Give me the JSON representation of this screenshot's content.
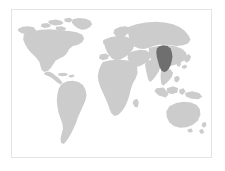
{
  "map": {
    "title": "World locator map",
    "projection": "equirectangular",
    "frame": {
      "visible": true,
      "border_color": "#e4e4e4",
      "x": 11,
      "y": 9,
      "width": 201,
      "height": 149
    },
    "colors": {
      "ocean": "#ffffff",
      "background": "#ffffff",
      "land": "#cccccc",
      "highlight": "#6f6f6f"
    },
    "legend": {
      "visible": false,
      "entries": []
    },
    "labels": {
      "visible": false,
      "items": []
    },
    "graticule": {
      "visible": false
    },
    "highlight": {
      "region_name": "China",
      "continent": "Asia",
      "color": "#6f6f6f",
      "approx_center_x": 169,
      "approx_center_y": 74
    },
    "landmasses": [
      {
        "name": "North America",
        "highlighted": false
      },
      {
        "name": "Greenland",
        "highlighted": false
      },
      {
        "name": "South America",
        "highlighted": false
      },
      {
        "name": "Europe",
        "highlighted": false
      },
      {
        "name": "Africa",
        "highlighted": false
      },
      {
        "name": "Asia",
        "highlighted": false
      },
      {
        "name": "China",
        "highlighted": true
      },
      {
        "name": "Southeast Asia and Indonesia",
        "highlighted": false
      },
      {
        "name": "Australia",
        "highlighted": false
      },
      {
        "name": "New Zealand",
        "highlighted": false
      },
      {
        "name": "Japan",
        "highlighted": false
      },
      {
        "name": "Madagascar",
        "highlighted": false
      },
      {
        "name": "British Isles",
        "highlighted": false
      }
    ]
  }
}
